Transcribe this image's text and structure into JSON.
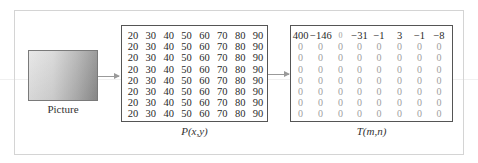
{
  "picture": {
    "label": "Picture"
  },
  "p_matrix": {
    "label": "P(x,y)",
    "rows": [
      [
        "20",
        "30",
        "40",
        "50",
        "60",
        "70",
        "80",
        "90"
      ],
      [
        "20",
        "30",
        "40",
        "50",
        "60",
        "70",
        "80",
        "90"
      ],
      [
        "20",
        "30",
        "40",
        "50",
        "60",
        "70",
        "80",
        "90"
      ],
      [
        "20",
        "30",
        "40",
        "50",
        "60",
        "70",
        "80",
        "90"
      ],
      [
        "20",
        "30",
        "40",
        "50",
        "60",
        "70",
        "80",
        "90"
      ],
      [
        "20",
        "30",
        "40",
        "50",
        "60",
        "70",
        "80",
        "90"
      ],
      [
        "20",
        "30",
        "40",
        "50",
        "60",
        "70",
        "80",
        "90"
      ],
      [
        "20",
        "30",
        "40",
        "50",
        "60",
        "70",
        "80",
        "90"
      ]
    ]
  },
  "t_matrix": {
    "label": "T(m,n)",
    "rows": [
      [
        "400",
        "−146",
        "0",
        "−31",
        "−1",
        "3",
        "−1",
        "−8"
      ],
      [
        "0",
        "0",
        "0",
        "0",
        "0",
        "0",
        "0",
        "0"
      ],
      [
        "0",
        "0",
        "0",
        "0",
        "0",
        "0",
        "0",
        "0"
      ],
      [
        "0",
        "0",
        "0",
        "0",
        "0",
        "0",
        "0",
        "0"
      ],
      [
        "0",
        "0",
        "0",
        "0",
        "0",
        "0",
        "0",
        "0"
      ],
      [
        "0",
        "0",
        "0",
        "0",
        "0",
        "0",
        "0",
        "0"
      ],
      [
        "0",
        "0",
        "0",
        "0",
        "0",
        "0",
        "0",
        "0"
      ],
      [
        "0",
        "0",
        "0",
        "0",
        "0",
        "0",
        "0",
        "0"
      ]
    ]
  },
  "colors": {
    "matrix_border": "#555555",
    "zero_text": "#a0a0a0",
    "arrow": "#9a9a9a",
    "outer_border": "#d4d4d4"
  }
}
